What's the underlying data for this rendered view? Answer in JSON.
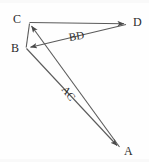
{
  "figure": {
    "background_color": "#fefefe",
    "stroke_color": "#5a5a5a",
    "text_color": "#2b2b2b",
    "width": 149,
    "height": 162
  },
  "points": [
    {
      "id": "A",
      "label": "A",
      "x": 120,
      "y": 148,
      "label_x": 124,
      "label_y": 145
    },
    {
      "id": "B",
      "label": "B",
      "x": 26,
      "y": 48,
      "label_x": 11,
      "label_y": 42
    },
    {
      "id": "C",
      "label": "C",
      "x": 29,
      "y": 23,
      "label_x": 13,
      "label_y": 13
    },
    {
      "id": "D",
      "label": "D",
      "x": 127,
      "y": 24,
      "label_x": 133,
      "label_y": 16
    }
  ],
  "segments": [
    {
      "id": "CD",
      "from": "C",
      "to": "D",
      "arrow_at": "D",
      "label": ""
    },
    {
      "id": "CB",
      "from": "C",
      "to": "B",
      "arrow_at": "none",
      "label": ""
    },
    {
      "id": "DB",
      "from": "D",
      "to": "B",
      "arrow_at": "B",
      "label": "BD"
    },
    {
      "id": "BA",
      "from": "B",
      "to": "A",
      "arrow_at": "A",
      "label": ""
    },
    {
      "id": "AC",
      "from": "A",
      "to": "C",
      "arrow_at": "C",
      "label": "AC"
    }
  ],
  "segment_labels": [
    {
      "id": "BD",
      "text": "BD",
      "x": 68,
      "y": 32,
      "rotation": -9
    },
    {
      "id": "AC",
      "text": "AC",
      "x": 68,
      "y": 84,
      "rotation": 52
    }
  ]
}
